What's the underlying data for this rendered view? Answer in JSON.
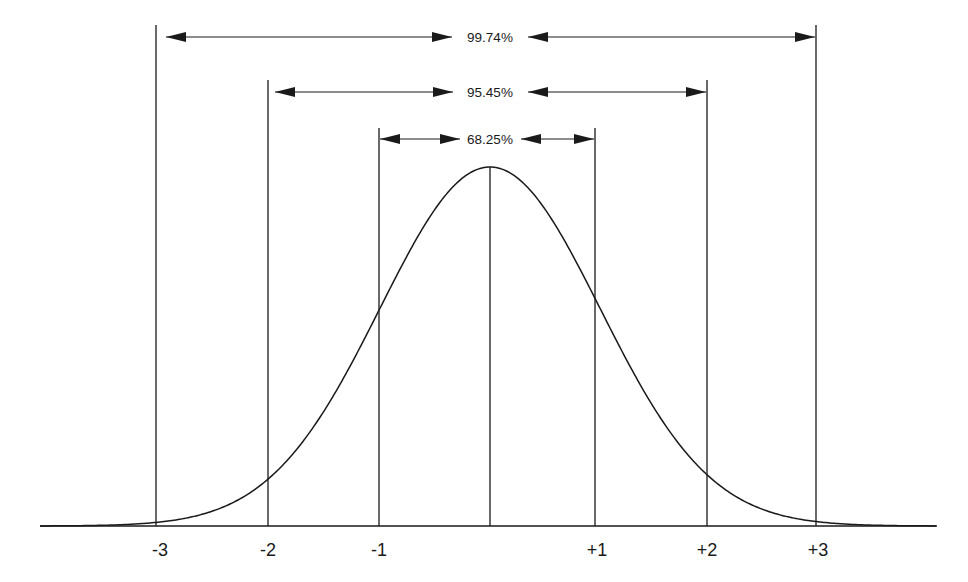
{
  "chart_data": {
    "type": "line",
    "title": "",
    "subtitle": "",
    "xlabel": "",
    "ylabel": "",
    "x_ticks": [
      "-3",
      "-2",
      "-1",
      "+1",
      "+2",
      "+3"
    ],
    "x_tick_values": [
      -3,
      -2,
      -1,
      1,
      2,
      3
    ],
    "xlim": [
      -4.1,
      4.1
    ],
    "grid": false,
    "legend": null,
    "series": [
      {
        "name": "normal density",
        "x": [
          -4,
          -3.5,
          -3,
          -2.5,
          -2,
          -1.5,
          -1,
          -0.5,
          0,
          0.5,
          1,
          1.5,
          2,
          2.5,
          3,
          3.5,
          4
        ],
        "values": [
          0.0001,
          0.0009,
          0.0044,
          0.0175,
          0.054,
          0.1295,
          0.242,
          0.3521,
          0.3989,
          0.3521,
          0.242,
          0.1295,
          0.054,
          0.0175,
          0.0044,
          0.0009,
          0.0001
        ]
      }
    ],
    "vertical_markers": [
      -3,
      -2,
      -1,
      0,
      1,
      2,
      3
    ],
    "annotations": [
      {
        "label": "99.74%",
        "from": -3,
        "to": 3
      },
      {
        "label": "95.45%",
        "from": -2,
        "to": 2
      },
      {
        "label": "68.25%",
        "from": -1,
        "to": 1
      }
    ]
  },
  "labels": {
    "bracket_3sd": "99.74%",
    "bracket_2sd": "95.45%",
    "bracket_1sd": "68.25%",
    "tick_m3": "-3",
    "tick_m2": "-2",
    "tick_m1": "-1",
    "tick_p1": "+1",
    "tick_p2": "+2",
    "tick_p3": "+3"
  },
  "colors": {
    "ink": "#1a1a1a",
    "background": "#ffffff"
  }
}
